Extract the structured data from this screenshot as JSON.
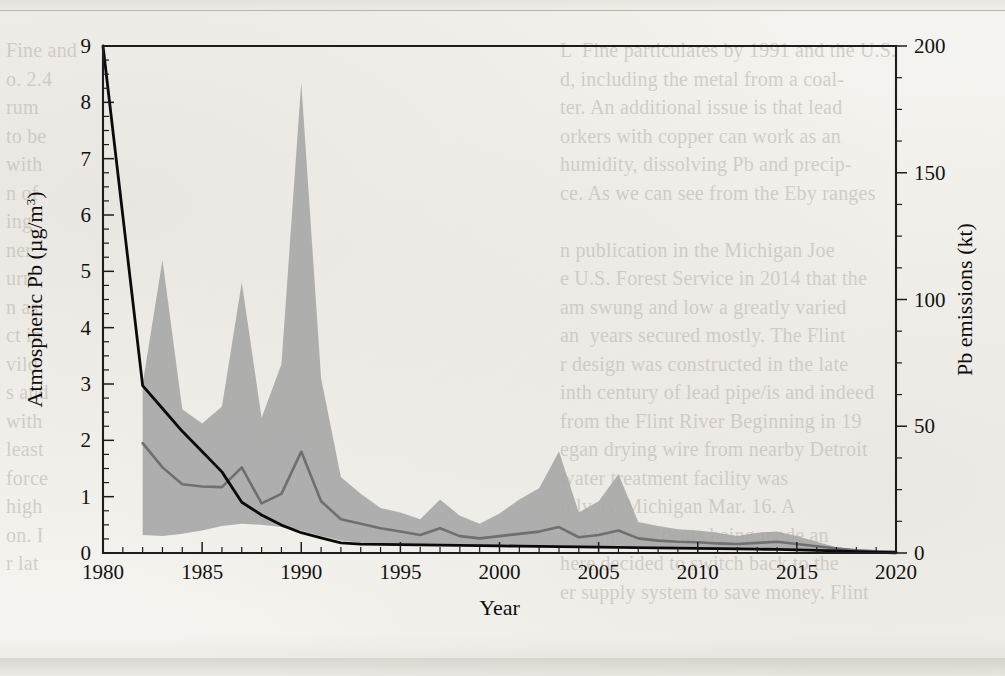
{
  "page": {
    "background_color": "#f3f1ec",
    "ghost_text_left": [
      "Fine and",
      "o. 2.4",
      "rum",
      "to be",
      "with",
      "n of",
      "ing",
      "ner",
      "urn",
      "n as",
      "ct in",
      "vild",
      "s and",
      "with",
      "least",
      "force",
      "high",
      "on. I",
      "r lat"
    ],
    "ghost_text_right": [
      "L  Fine particulates by 1991 and the U.S.",
      "d, including the metal from a coal-",
      "ter. An additional issue is that lead",
      "orkers with copper can work as an",
      "humidity, dissolving Pb and precip-",
      "ce. As we can see from the Eby ranges",
      "",
      "n publication in the Michigan Joe",
      "e U.S. Forest Service in 2014 that the",
      "am swung and low a greatly varied",
      "an  years secured mostly. The Flint",
      "r design was constructed in the late",
      "inth century of lead pipe/is and indeed",
      "from the Flint River Beginning in 19",
      "egan drying wire from nearby Detroit",
      "water treatment facility was",
      "rely as  Michigan Mar. 16. A",
      "of Flint  residents being made an",
      "here decided to switch back to the",
      "er supply system to save money. Flint"
    ]
  },
  "chart_data": {
    "type": "area",
    "title": "",
    "xlabel": "Year",
    "ylabel": "Atmospheric Pb (µg/m³)",
    "y2label": "Pb emissions (kt)",
    "xlim": [
      1980,
      2020
    ],
    "ylim": [
      0,
      9
    ],
    "y2lim": [
      0,
      200
    ],
    "xticks": [
      1980,
      1985,
      1990,
      1995,
      2000,
      2005,
      2010,
      2015,
      2020
    ],
    "xticklabels": [
      "1980",
      "1985",
      "1990",
      "1995",
      "2000",
      "2005",
      "2010",
      "2015",
      "2020"
    ],
    "x_minor_step": 1,
    "yticks": [
      0,
      1,
      2,
      3,
      4,
      5,
      6,
      7,
      8,
      9
    ],
    "yticklabels": [
      "0",
      "1",
      "2",
      "3",
      "4",
      "5",
      "6",
      "7",
      "8",
      "9"
    ],
    "y_minor_step": 0.25,
    "y2ticks": [
      0,
      50,
      100,
      150,
      200
    ],
    "y2ticklabels": [
      "0",
      "50",
      "100",
      "150",
      "200"
    ],
    "y2_minor_step": 12.5,
    "grid": false,
    "legend": "none",
    "colors": {
      "band": "#a8a8a8",
      "median": "#6f6f6f",
      "emissions_line": "#0a0a0a",
      "axis": "#1d1d1d"
    },
    "series": [
      {
        "name": "Atmospheric Pb range (max)",
        "axis": "left",
        "x": [
          1982,
          1983,
          1984,
          1985,
          1986,
          1987,
          1988,
          1989,
          1990,
          1991,
          1992,
          1993,
          1994,
          1995,
          1996,
          1997,
          1998,
          1999,
          2000,
          2001,
          2002,
          2003,
          2004,
          2005,
          2006,
          2007,
          2008,
          2009,
          2010,
          2011,
          2012,
          2013,
          2014,
          2015,
          2016,
          2017,
          2018,
          2019,
          2020
        ],
        "values": [
          3.0,
          5.2,
          2.55,
          2.3,
          2.6,
          4.8,
          2.4,
          3.35,
          8.35,
          3.1,
          1.35,
          1.05,
          0.8,
          0.72,
          0.6,
          0.95,
          0.66,
          0.52,
          0.7,
          0.95,
          1.15,
          1.8,
          0.72,
          0.92,
          1.4,
          0.55,
          0.48,
          0.42,
          0.4,
          0.36,
          0.3,
          0.36,
          0.38,
          0.3,
          0.2,
          0.1,
          0.06,
          0.04,
          0.02
        ]
      },
      {
        "name": "Atmospheric Pb range (min)",
        "axis": "left",
        "x": [
          1982,
          1983,
          1984,
          1985,
          1986,
          1987,
          1988,
          1989,
          1990,
          1991,
          1992,
          1993,
          1994,
          1995,
          1996,
          1997,
          1998,
          1999,
          2000,
          2001,
          2002,
          2003,
          2004,
          2005,
          2006,
          2007,
          2008,
          2009,
          2010,
          2011,
          2012,
          2013,
          2014,
          2015,
          2016,
          2017,
          2018,
          2019,
          2020
        ],
        "values": [
          0.32,
          0.3,
          0.34,
          0.4,
          0.48,
          0.52,
          0.5,
          0.46,
          0.4,
          0.3,
          0.22,
          0.18,
          0.16,
          0.15,
          0.14,
          0.14,
          0.13,
          0.12,
          0.12,
          0.12,
          0.12,
          0.13,
          0.12,
          0.12,
          0.13,
          0.12,
          0.11,
          0.1,
          0.1,
          0.09,
          0.08,
          0.08,
          0.08,
          0.07,
          0.06,
          0.05,
          0.04,
          0.03,
          0.02
        ]
      },
      {
        "name": "Atmospheric Pb median",
        "axis": "left",
        "x": [
          1982,
          1983,
          1984,
          1985,
          1986,
          1987,
          1988,
          1989,
          1990,
          1991,
          1992,
          1993,
          1994,
          1995,
          1996,
          1997,
          1998,
          1999,
          2000,
          2001,
          2002,
          2003,
          2004,
          2005,
          2006,
          2007,
          2008,
          2009,
          2010,
          2011,
          2012,
          2013,
          2014,
          2015,
          2016,
          2017,
          2018,
          2019,
          2020
        ],
        "values": [
          1.95,
          1.52,
          1.22,
          1.18,
          1.17,
          1.52,
          0.88,
          1.05,
          1.8,
          0.92,
          0.6,
          0.52,
          0.44,
          0.38,
          0.32,
          0.44,
          0.3,
          0.26,
          0.3,
          0.34,
          0.38,
          0.46,
          0.28,
          0.32,
          0.4,
          0.26,
          0.22,
          0.2,
          0.19,
          0.17,
          0.16,
          0.18,
          0.2,
          0.16,
          0.12,
          0.08,
          0.05,
          0.03,
          0.02
        ]
      },
      {
        "name": "Pb emissions",
        "axis": "right",
        "x": [
          1980,
          1981,
          1982,
          1983,
          1984,
          1985,
          1986,
          1987,
          1988,
          1989,
          1990,
          1991,
          1992,
          1993,
          1994,
          1995,
          1996,
          1997,
          1998,
          1999,
          2000,
          2001,
          2002,
          2003,
          2004,
          2005,
          2006,
          2007,
          2008,
          2009,
          2010,
          2011,
          2012,
          2013,
          2014,
          2015,
          2016,
          2017,
          2018,
          2019,
          2020
        ],
        "values": [
          200,
          133,
          66,
          57,
          48,
          40,
          32,
          20,
          15,
          11,
          8,
          6,
          4,
          3.5,
          3.4,
          3.3,
          3.2,
          3.1,
          3.0,
          2.9,
          2.8,
          2.7,
          2.6,
          2.5,
          2.4,
          2.3,
          2.2,
          2.1,
          2.0,
          1.9,
          1.8,
          1.7,
          1.6,
          1.5,
          1.4,
          1.2,
          1.0,
          0.8,
          0.5,
          0.3,
          0.1
        ]
      }
    ]
  }
}
